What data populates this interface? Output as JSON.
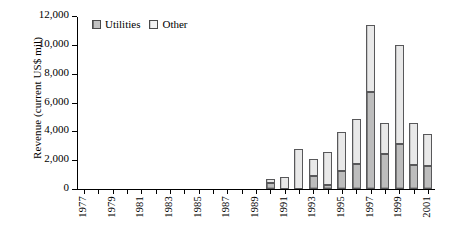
{
  "chart_data": {
    "type": "bar",
    "subtype": "stacked-bar",
    "title": "",
    "xlabel": "",
    "ylabel": "Revenue (current US$ mil)",
    "ylim": [
      0,
      12000
    ],
    "ytick_values": [
      0,
      2000,
      4000,
      6000,
      8000,
      10000,
      12000
    ],
    "ytick_labels": [
      "0",
      "2,000",
      "4,000",
      "6,000",
      "8,000",
      "10,000",
      "12,000"
    ],
    "grid": false,
    "legend_position": "top-left",
    "categories": [
      1977,
      1978,
      1979,
      1980,
      1981,
      1982,
      1983,
      1984,
      1985,
      1986,
      1987,
      1988,
      1989,
      1990,
      1991,
      1992,
      1993,
      1994,
      1995,
      1996,
      1997,
      1998,
      1999,
      2000,
      2001
    ],
    "xtick_labels": [
      "1977",
      "",
      "1979",
      "",
      "1981",
      "",
      "1983",
      "",
      "1985",
      "",
      "1987",
      "",
      "1989",
      "",
      "1991",
      "",
      "1993",
      "",
      "1995",
      "",
      "1997",
      "",
      "1999",
      "",
      "2001"
    ],
    "series": [
      {
        "name": "Utilities",
        "color": "#bdbdbd",
        "values": [
          0,
          0,
          0,
          0,
          0,
          0,
          0,
          0,
          0,
          0,
          0,
          0,
          0,
          400,
          0,
          0,
          900,
          250,
          1250,
          1750,
          6750,
          2400,
          3100,
          1700,
          1600
        ]
      },
      {
        "name": "Other",
        "color": "#e9e9e9",
        "values": [
          0,
          0,
          0,
          0,
          0,
          0,
          0,
          0,
          0,
          0,
          0,
          0,
          0,
          300,
          800,
          2750,
          1200,
          2300,
          2700,
          3100,
          4600,
          2150,
          6900,
          2850,
          2200
        ]
      }
    ],
    "totals": [
      0,
      0,
      0,
      0,
      0,
      0,
      0,
      0,
      0,
      0,
      0,
      0,
      0,
      700,
      800,
      2750,
      2100,
      2550,
      3950,
      4850,
      11350,
      4550,
      10000,
      4550,
      3800
    ]
  },
  "legend": {
    "items": [
      {
        "label": "Utilities",
        "swatch": "utilities-swatch-icon"
      },
      {
        "label": "Other",
        "swatch": "other-swatch-icon"
      }
    ]
  }
}
